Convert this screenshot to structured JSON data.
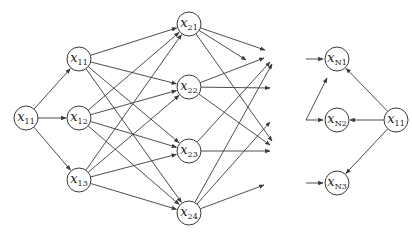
{
  "diagram": {
    "type": "neural-network-layers",
    "node_radius": 12,
    "nodes": [
      {
        "id": "l0_1",
        "base": "x",
        "sub": "11",
        "x": 26,
        "y": 118
      },
      {
        "id": "l1_1",
        "base": "x",
        "sub": "11",
        "x": 79,
        "y": 59
      },
      {
        "id": "l1_2",
        "base": "x",
        "sub": "12",
        "x": 79,
        "y": 118
      },
      {
        "id": "l1_3",
        "base": "x",
        "sub": "13",
        "x": 79,
        "y": 180
      },
      {
        "id": "l2_1",
        "base": "x",
        "sub": "21",
        "x": 189,
        "y": 24
      },
      {
        "id": "l2_2",
        "base": "x",
        "sub": "22",
        "x": 189,
        "y": 87
      },
      {
        "id": "l2_3",
        "base": "x",
        "sub": "23",
        "x": 189,
        "y": 151
      },
      {
        "id": "l2_4",
        "base": "x",
        "sub": "24",
        "x": 189,
        "y": 213
      },
      {
        "id": "ln_1",
        "base": "x",
        "sub": "N1",
        "x": 337,
        "y": 59
      },
      {
        "id": "ln_2",
        "base": "x",
        "sub": "N2",
        "x": 337,
        "y": 120
      },
      {
        "id": "ln_3",
        "base": "x",
        "sub": "N3",
        "x": 337,
        "y": 183
      },
      {
        "id": "r_1",
        "base": "x",
        "sub": "11",
        "x": 396,
        "y": 120
      }
    ],
    "edges": [
      {
        "from": "l0_1",
        "to": "l1_1"
      },
      {
        "from": "l0_1",
        "to": "l1_2"
      },
      {
        "from": "l0_1",
        "to": "l1_3"
      },
      {
        "from": "l1_1",
        "to": "l2_1"
      },
      {
        "from": "l1_1",
        "to": "l2_2"
      },
      {
        "from": "l1_1",
        "to": "l2_3"
      },
      {
        "from": "l1_1",
        "to": "l2_4"
      },
      {
        "from": "l1_2",
        "to": "l2_1"
      },
      {
        "from": "l1_2",
        "to": "l2_2"
      },
      {
        "from": "l1_2",
        "to": "l2_3"
      },
      {
        "from": "l1_2",
        "to": "l2_4"
      },
      {
        "from": "l1_3",
        "to": "l2_1"
      },
      {
        "from": "l1_3",
        "to": "l2_2"
      },
      {
        "from": "l1_3",
        "to": "l2_3"
      },
      {
        "from": "l1_3",
        "to": "l2_4"
      },
      {
        "from": "r_1",
        "to": "ln_1"
      },
      {
        "from": "r_1",
        "to": "ln_2"
      },
      {
        "from": "r_1",
        "to": "ln_3"
      }
    ],
    "dangling_edges": [
      {
        "from": "l2_1",
        "tx": 265,
        "ty": 50
      },
      {
        "from": "l2_1",
        "tx": 246,
        "ty": 60
      },
      {
        "from": "l2_1",
        "tx": 272,
        "ty": 141
      },
      {
        "from": "l2_2",
        "tx": 264,
        "ty": 58
      },
      {
        "from": "l2_2",
        "tx": 270,
        "ty": 88
      },
      {
        "from": "l2_2",
        "tx": 270,
        "ty": 145
      },
      {
        "from": "l2_3",
        "tx": 270,
        "ty": 62
      },
      {
        "from": "l2_3",
        "tx": 270,
        "ty": 151
      },
      {
        "from": "l2_4",
        "tx": 272,
        "ty": 64
      },
      {
        "from": "l2_4",
        "tx": 270,
        "ty": 122
      },
      {
        "from": "l2_4",
        "tx": 264,
        "ty": 185
      }
    ],
    "incoming_stubs": [
      {
        "points": [
          [
            306,
            59
          ],
          [
            323,
            59
          ]
        ]
      },
      {
        "points": [
          [
            306,
            120
          ],
          [
            323,
            120
          ]
        ],
        "branch": [
          [
            306,
            120
          ],
          [
            327,
            78
          ]
        ]
      },
      {
        "points": [
          [
            306,
            183
          ],
          [
            323,
            183
          ]
        ]
      }
    ]
  }
}
